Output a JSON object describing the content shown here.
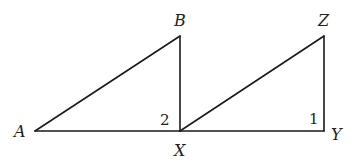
{
  "diagram": {
    "type": "geometry",
    "triangles": [
      {
        "name": "ABX",
        "vertices": [
          "A",
          "B",
          "X"
        ]
      },
      {
        "name": "XZY",
        "vertices": [
          "X",
          "Z",
          "Y"
        ]
      }
    ],
    "points": {
      "A": {
        "label": "A",
        "x": 35,
        "y": 131
      },
      "B": {
        "label": "B",
        "x": 180,
        "y": 36
      },
      "X": {
        "label": "X",
        "x": 180,
        "y": 131
      },
      "Z": {
        "label": "Z",
        "x": 324,
        "y": 36
      },
      "Y": {
        "label": "Y",
        "x": 324,
        "y": 131
      }
    },
    "segments": [
      [
        "A",
        "B"
      ],
      [
        "B",
        "X"
      ],
      [
        "A",
        "X"
      ],
      [
        "X",
        "Z"
      ],
      [
        "Z",
        "Y"
      ],
      [
        "X",
        "Y"
      ]
    ],
    "angles": {
      "angle2": {
        "label": "2",
        "vertex": "X",
        "description": "angle BXA"
      },
      "angle1": {
        "label": "1",
        "vertex": "Y",
        "description": "angle XYZ"
      }
    },
    "line_color": "#1a1a1a"
  }
}
